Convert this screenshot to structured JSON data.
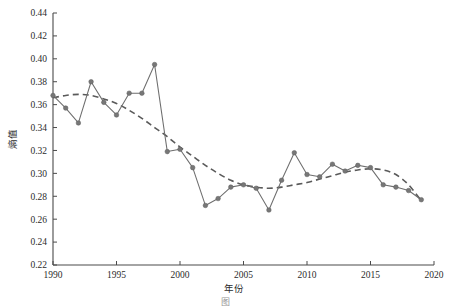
{
  "figure": {
    "caption": "图",
    "background_color": "#ffffff",
    "series_color": "#6e6e6e",
    "marker_color": "#777777",
    "trend_color": "#5a5a5a",
    "axis_color": "#4a4a4a"
  },
  "chart_data": {
    "type": "line",
    "title": "",
    "xlabel": "年份",
    "ylabel": "熵值",
    "xlim": [
      1990,
      2020
    ],
    "ylim": [
      0.22,
      0.44
    ],
    "xticks": [
      1990,
      1995,
      2000,
      2005,
      2010,
      2015,
      2020
    ],
    "xtick_labels": [
      "1990",
      "1995",
      "2000",
      "2005",
      "2010",
      "2015",
      "2020"
    ],
    "yticks": [
      0.22,
      0.24,
      0.26,
      0.28,
      0.3,
      0.32,
      0.34,
      0.36,
      0.38,
      0.4,
      0.42,
      0.44
    ],
    "ytick_labels": [
      "0.22",
      "0.24",
      "0.26",
      "0.28",
      "0.30",
      "0.32",
      "0.34",
      "0.36",
      "0.38",
      "0.40",
      "0.42",
      "0.44"
    ],
    "grid": false,
    "legend": false,
    "x": [
      1990,
      1991,
      1992,
      1993,
      1994,
      1995,
      1996,
      1997,
      1998,
      1999,
      2000,
      2001,
      2002,
      2003,
      2004,
      2005,
      2006,
      2007,
      2008,
      2009,
      2010,
      2011,
      2012,
      2013,
      2014,
      2015,
      2016,
      2017,
      2018,
      2019
    ],
    "series": [
      {
        "name": "熵值",
        "style": "solid-with-markers",
        "values": [
          0.368,
          0.357,
          0.344,
          0.38,
          0.362,
          0.351,
          0.37,
          0.37,
          0.395,
          0.319,
          0.321,
          0.305,
          0.272,
          0.278,
          0.288,
          0.29,
          0.287,
          0.268,
          0.294,
          0.318,
          0.299,
          0.297,
          0.308,
          0.302,
          0.307,
          0.305,
          0.29,
          0.288,
          0.285,
          0.277
        ],
        "note": "observed entropy value per year"
      },
      {
        "name": "趋势线",
        "style": "dashed",
        "values": [
          0.366,
          0.368,
          0.369,
          0.368,
          0.365,
          0.361,
          0.355,
          0.348,
          0.34,
          0.332,
          0.323,
          0.315,
          0.307,
          0.3,
          0.294,
          0.29,
          0.288,
          0.287,
          0.288,
          0.29,
          0.292,
          0.295,
          0.298,
          0.301,
          0.303,
          0.304,
          0.303,
          0.299,
          0.29,
          0.276
        ],
        "note": "fitted polynomial trend, dashed"
      }
    ]
  }
}
